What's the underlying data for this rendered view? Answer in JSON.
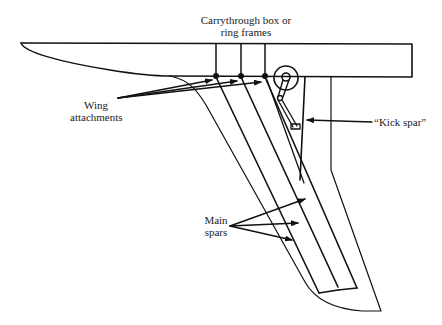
{
  "diagram": {
    "type": "structural-schematic",
    "labels": {
      "carrythrough_line1": "Carrythrough box or",
      "carrythrough_line2": "ring frames",
      "wing_attachments_line1": "Wing",
      "wing_attachments_line2": "attachments",
      "kick_spar": "“Kick spar”",
      "main_spars_line1": "Main",
      "main_spars_line2": "spars"
    },
    "colors": {
      "line": "#111111",
      "text": "#1a1a1a",
      "background": "#ffffff"
    }
  }
}
